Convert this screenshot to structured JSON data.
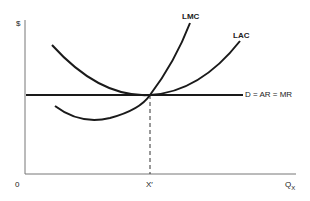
{
  "diagram": {
    "y_axis_label": "$",
    "origin_label": "0",
    "x_axis_label": "Q",
    "x_axis_subscript": "X",
    "x_marker_label": "X′",
    "curves": {
      "lmc": "LMC",
      "lac": "LAC",
      "demand": "D = AR = MR"
    },
    "colors": {
      "line": "#1a1a1a",
      "axis": "#555555"
    }
  }
}
